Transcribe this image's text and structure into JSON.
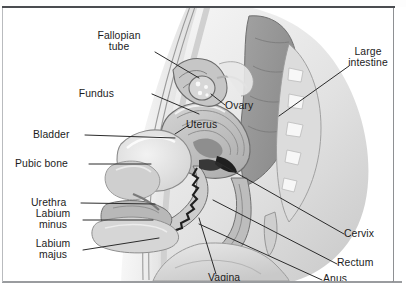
{
  "figure": {
    "style": "grayscale medical illustration",
    "frame_color": "#4a4c50",
    "background_color": "#ffffff"
  },
  "labels": [
    {
      "id": "fallopian-tube",
      "text": "Fallopian\ntube",
      "side": "left",
      "x": 106,
      "y": 28,
      "align": "center"
    },
    {
      "id": "fundus",
      "text": "Fundus",
      "side": "left",
      "x": 113,
      "y": 82,
      "align": "right"
    },
    {
      "id": "bladder",
      "text": "Bladder",
      "side": "left",
      "x": 36,
      "y": 123,
      "align": "left"
    },
    {
      "id": "pubic-bone",
      "text": "Pubic bone",
      "side": "left",
      "x": 18,
      "y": 152,
      "align": "left"
    },
    {
      "id": "urethra",
      "text": "Urethra",
      "side": "left",
      "x": 34,
      "y": 191,
      "align": "left"
    },
    {
      "id": "labium-minus",
      "text": "Labium\nminus",
      "side": "left",
      "x": 36,
      "y": 207,
      "align": "center"
    },
    {
      "id": "labium-majus",
      "text": "Labium\nmajus",
      "side": "left",
      "x": 34,
      "y": 237,
      "align": "center"
    },
    {
      "id": "uterus",
      "text": "Uterus",
      "side": "inner",
      "x": 189,
      "y": 113,
      "align": "left"
    },
    {
      "id": "ovary",
      "text": "Ovary",
      "side": "inner",
      "x": 228,
      "y": 95,
      "align": "left"
    },
    {
      "id": "vagina",
      "text": "Vagina",
      "side": "bottom",
      "x": 211,
      "y": 272,
      "align": "left"
    },
    {
      "id": "large-intestine",
      "text": "Large\nintestine",
      "side": "right",
      "x": 349,
      "y": 45,
      "align": "left"
    },
    {
      "id": "cervix",
      "text": "Cervix",
      "side": "right",
      "x": 344,
      "y": 223,
      "align": "left"
    },
    {
      "id": "rectum",
      "text": "Rectum",
      "side": "right",
      "x": 337,
      "y": 252,
      "align": "left"
    },
    {
      "id": "anus",
      "text": "Anus",
      "side": "right",
      "x": 322,
      "y": 272,
      "align": "left"
    }
  ],
  "structures": [
    "body-silhouette",
    "abdominal-wall",
    "uterus",
    "ovary",
    "fallopian-tube",
    "bladder",
    "pubic-bone",
    "urethra",
    "labium-minus",
    "labium-majus",
    "vagina",
    "cervix",
    "rectum",
    "anus",
    "large-intestine",
    "sacrum",
    "coccyx"
  ],
  "palette": {
    "skin_light": "#ebebeb",
    "skin_mid": "#d8d8d8",
    "tissue": "#c3c3c3",
    "organ_dark": "#949494",
    "bone_light": "#f3f3f3",
    "outline": "#6f6f6f",
    "leader_line": "#2b2b2b",
    "text": "#1c1c1c"
  }
}
